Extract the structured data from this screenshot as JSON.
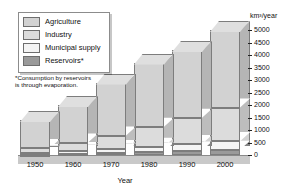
{
  "chart_data": {
    "type": "bar",
    "subtype": "stacked-3d-column",
    "title": "",
    "xlabel": "Year",
    "ylabel": "km³/year",
    "ylim": [
      0,
      5000
    ],
    "yticks": [
      0,
      500,
      1000,
      1500,
      2000,
      2500,
      3000,
      3500,
      4000,
      4500,
      5000
    ],
    "ytick_labels": [
      "0",
      "500",
      "1000",
      "1500",
      "2000",
      "2500",
      "3000",
      "3500",
      "4000",
      "4500",
      "5000"
    ],
    "categories": [
      "1950",
      "1960",
      "1970",
      "1980",
      "1990",
      "2000"
    ],
    "grid": false,
    "legend_position": "top-left",
    "stack_order_bottom_to_top": [
      "Reservoirs*",
      "Municipal supply",
      "Industry",
      "Agriculture"
    ],
    "series": [
      {
        "name": "Reservoirs*",
        "values": [
          20,
          60,
          100,
          140,
          180,
          210
        ]
      },
      {
        "name": "Municipal supply",
        "values": [
          60,
          90,
          130,
          190,
          260,
          340
        ]
      },
      {
        "name": "Industry",
        "values": [
          200,
          350,
          550,
          800,
          1050,
          1350
        ]
      },
      {
        "name": "Agriculture",
        "values": [
          1120,
          1500,
          2120,
          2570,
          2710,
          3100
        ]
      }
    ],
    "totals": [
      1400,
      2000,
      2900,
      3700,
      4200,
      5000
    ],
    "annotations": [
      "*Consumption by reservoirs is through evaporation."
    ]
  },
  "legend": {
    "items": [
      {
        "label": "Agriculture",
        "color": "#d2d2d2"
      },
      {
        "label": "Industry",
        "color": "#dcdcdc"
      },
      {
        "label": "Municipal supply",
        "color": "#f4f4f4"
      },
      {
        "label": "Reservoirs*",
        "color": "#9a9a9a"
      }
    ]
  },
  "footnote": {
    "line1": "*Consumption by reservoirs",
    "line2": "is through evaporation."
  },
  "axis": {
    "unit_label": "km³/year",
    "x_title": "Year"
  }
}
